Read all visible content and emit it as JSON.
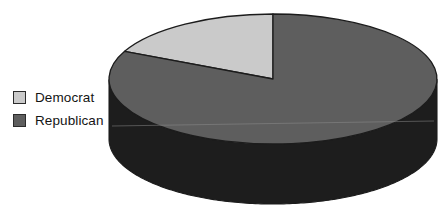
{
  "chart_data": {
    "type": "pie",
    "title": "",
    "subtitle": "",
    "xlabel": "",
    "ylabel": "",
    "grid": false,
    "three_d": true,
    "start_angle_deg": 90,
    "direction": "counterclockwise",
    "legend_position": "left",
    "categories": [
      "Democrat",
      "Republican"
    ],
    "values": [
      18,
      82
    ],
    "slices": [
      {
        "label": "Democrat",
        "value": 18,
        "percent": 18,
        "angle_deg": 64.4,
        "color": "#cacaca",
        "side_color": "#9a9a9a",
        "edge_color": "#1c1c1c"
      },
      {
        "label": "Republican",
        "value": 82,
        "percent": 82,
        "angle_deg": 295.6,
        "color": "#5e5e5e",
        "side_color": "#1d1d1d",
        "edge_color": "#1c1c1c"
      }
    ],
    "annotations": []
  },
  "legend": {
    "items": [
      {
        "label": "Democrat",
        "swatch_color": "#cacaca"
      },
      {
        "label": "Republican",
        "swatch_color": "#5e5e5e"
      }
    ]
  },
  "geometry": {
    "center_x": 273,
    "center_y": 79,
    "radius_x": 164,
    "radius_y": 65,
    "depth": 60
  },
  "colors": {
    "background": "#ffffff",
    "text": "#141414",
    "outline": "#1c1c1c"
  }
}
